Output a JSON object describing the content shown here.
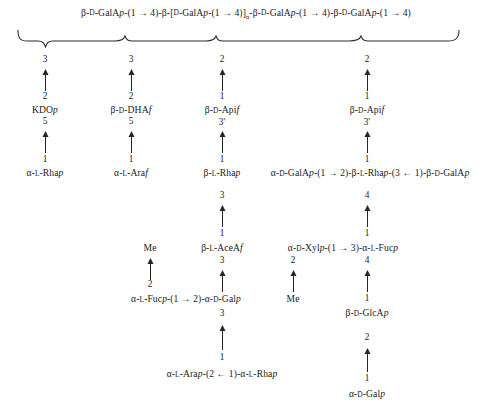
{
  "figure": {
    "kind": "polysaccharide-structure-diagram"
  },
  "backbone": {
    "text": "β-D-GalAp-(1 → 4)-β-[D-GalAp-(1 → 4)]n-β-D-GalAp-(1 → 4)-β-D-GalAp-(1 → 4)",
    "segments": [
      {
        "greek": "β",
        "config": "D",
        "residue": "GalA",
        "ring": "p",
        "linkage": "(1 → 4)"
      },
      {
        "greek": "β",
        "bracket_open": "[",
        "config": "D",
        "residue": "GalA",
        "ring": "p",
        "linkage": "(1 → 4)",
        "bracket_close": "]",
        "subscript": "n"
      },
      {
        "greek": "β",
        "config": "D",
        "residue": "GalA",
        "ring": "p",
        "linkage": "(1 → 4)"
      },
      {
        "greek": "β",
        "config": "D",
        "residue": "GalA",
        "ring": "p",
        "linkage": "(1 → 4)"
      }
    ]
  },
  "attachment_points": [
    "3",
    "3",
    "2",
    "2"
  ],
  "columns": [
    {
      "id": "column-1",
      "nodes": [
        "2",
        "KDOp",
        "5",
        "1",
        "α-L-Rhap"
      ],
      "residues": [
        {
          "label_prefix": "KDO",
          "label_italic": "p",
          "upper_locant": "2",
          "lower_locant": "5"
        },
        {
          "label_prefix": "α-L-Rha",
          "label_italic": "p",
          "upper_locant": "1"
        }
      ]
    },
    {
      "id": "column-2",
      "residues": [
        {
          "label_prefix": "β-D-DHA",
          "label_italic": "f",
          "upper_locant": "2",
          "lower_locant": "5"
        },
        {
          "label_prefix": "α-L-Ara",
          "label_italic": "f",
          "upper_locant": "1"
        }
      ]
    },
    {
      "id": "column-3",
      "residues": [
        {
          "label_prefix": "β-D-Api",
          "label_italic": "f",
          "upper_locant": "1",
          "lower_locant": "3'"
        },
        {
          "label_prefix": "β-L-Rha",
          "label_italic": "p",
          "upper_locant": "1",
          "lower_locant": "3"
        },
        {
          "label_prefix": "β-L-AceA",
          "label_italic": "f",
          "upper_locant": "1",
          "lower_locant": "3"
        },
        {
          "label_prefix": "α-L-Fucp-(1 → 2)-α-D-Galp",
          "upper_locant": "2",
          "lower_locant": "3"
        },
        {
          "label_prefix": "α-L-Arap-(2 ← 1)-α-L-Rhap",
          "upper_locant": "1"
        }
      ]
    },
    {
      "id": "column-4",
      "residues": [
        {
          "label_prefix": "β-D-Api",
          "label_italic": "f",
          "upper_locant": "1",
          "lower_locant": "3'"
        },
        {
          "label_prefix": "α-D-GalAp-(1 → 2)-β-L-Rhap-(3 ← 1)-β-D-GalAp",
          "upper_locant": "1",
          "lower_locant": "4"
        },
        {
          "label_prefix": "α-D-Xylp-(1 → 3)-α-L-Fucp",
          "upper_locant": "1",
          "lower_locant_left": "2",
          "lower_locant_right": "4"
        },
        {
          "label_prefix": "β-D-GlcA",
          "label_italic": "p",
          "upper_locant": "1",
          "lower_locant": "2"
        },
        {
          "label_prefix": "α-D-Gal",
          "label_italic": "p",
          "upper_locant": "1"
        }
      ]
    }
  ],
  "labels": {
    "backbone_line": "β-D-GalAp-(1 → 4)-β-[D-GalAp-(1 → 4)]n-β-D-GalAp-(1 → 4)-β-D-GalAp-(1 → 4)",
    "loc_3a": "3",
    "loc_3b": "3",
    "loc_2a": "2",
    "loc_2b": "2",
    "c1_n2": "2",
    "c1_kdo": "KDO",
    "c1_kdo_it": "p",
    "c1_n5": "5",
    "c1_n1": "1",
    "c1_rha": "α-L-Rha",
    "c1_rha_it": "p",
    "c2_n2": "2",
    "c2_dha": "β-D-DHA",
    "c2_dha_it": "f",
    "c2_n5": "5",
    "c2_n1": "1",
    "c2_ara": "α-L-Ara",
    "c2_ara_it": "f",
    "c3_n1a": "1",
    "c3_api": "β-D-Api",
    "c3_api_it": "f",
    "c3_n3p": "3'",
    "c3_n1b": "1",
    "c3_rha": "β-L-Rha",
    "c3_rha_it": "p",
    "c3_n3a": "3",
    "c3_n1c": "1",
    "c3_acea": "β-L-AceA",
    "c3_acea_it": "f",
    "c3_n3b": "3",
    "c3_me": "Me",
    "c3_me_n2": "2",
    "c3_fucgal_a": "α-L-Fuc",
    "c3_fucgal_it1": "p",
    "c3_fucgal_mid": "-(1 → 2)-α-D-Gal",
    "c3_fucgal_it2": "p",
    "c3_n3c": "3",
    "c3_n1d": "1",
    "c3_ararha_a": "α-L-Ara",
    "c3_ararha_it1": "p",
    "c3_ararha_mid": "-(2 ← 1)-α-L-Rha",
    "c3_ararha_it2": "p",
    "c4_n1a": "1",
    "c4_api": "β-D-Api",
    "c4_api_it": "f",
    "c4_n3p": "3'",
    "c4_n1b": "1",
    "c4_chain_a": "α-D-GalA",
    "c4_chain_it1": "p",
    "c4_chain_m1": "-(1 → 2)-β-L-Rha",
    "c4_chain_it2": "p",
    "c4_chain_m2": "-(3 ← 1)-β-D-GalA",
    "c4_chain_it3": "p",
    "c4_n4a": "4",
    "c4_n1c": "1",
    "c4_xylfuc_a": "α-D-Xyl",
    "c4_xylfuc_it1": "p",
    "c4_xylfuc_mid": "-(1 → 3)-α-L-Fuc",
    "c4_xylfuc_it2": "p",
    "c4_n2x": "2",
    "c4_me": "Me",
    "c4_n4b": "4",
    "c4_n1d": "1",
    "c4_glca": "β-D-GlcA",
    "c4_glca_it": "p",
    "c4_n2g": "2",
    "c4_n1e": "1",
    "c4_gal": "α-D-Gal",
    "c4_gal_it": "p"
  },
  "colors": {
    "background": "#ffffff",
    "text": "#1a1a1a",
    "stroke": "#262626"
  }
}
